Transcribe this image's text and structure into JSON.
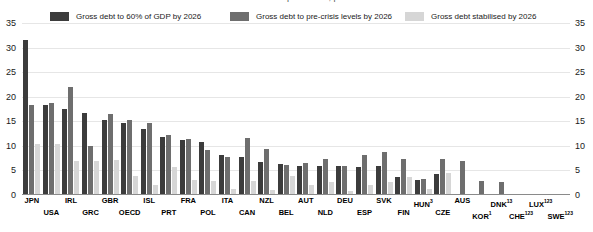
{
  "title": "Fiscal consolidation requirements, per cent of GDP",
  "legend": {
    "items": [
      {
        "label": "Gross debt to 60% of GDP by 2026",
        "color": "#3c3c3c"
      },
      {
        "label": "Gross debt to pre-crisis levels by 2026",
        "color": "#6e6e6e"
      },
      {
        "label": "Gross debt stabilised by 2026",
        "color": "#d6d6d6"
      }
    ]
  },
  "axis": {
    "left_ticks": [
      "35",
      "30",
      "25",
      "20",
      "15",
      "10",
      "5",
      "0"
    ],
    "right_ticks": [
      "35",
      "30",
      "25",
      "20",
      "15",
      "10",
      "5",
      "0"
    ]
  },
  "chart_data": {
    "type": "bar",
    "title": "Fiscal consolidation requirements, per cent of GDP",
    "xlabel": "",
    "ylabel": "",
    "ylim": [
      0,
      35
    ],
    "grid": true,
    "legend_position": "top",
    "categories": [
      "JPN",
      "USA",
      "IRL",
      "GRC",
      "GBR",
      "OECD",
      "ISL",
      "PRT",
      "FRA",
      "POL",
      "ITA",
      "CAN",
      "NZL",
      "BEL",
      "AUT",
      "NLD",
      "DEU",
      "ESP",
      "SVK",
      "FIN",
      "HUN",
      "CZE",
      "AUS",
      "KOR",
      "DNK",
      "CHE",
      "LUX",
      "SWE"
    ],
    "category_superscripts": [
      "",
      "",
      "",
      "",
      "",
      "",
      "",
      "",
      "",
      "",
      "",
      "",
      "",
      "",
      "",
      "",
      "",
      "",
      "",
      "",
      "3",
      "",
      "",
      "1",
      "13",
      "123",
      "123",
      "123"
    ],
    "series": [
      {
        "name": "Gross debt to 60% of GDP by 2026",
        "color": "#3c3c3c",
        "values": [
          31.3,
          18.2,
          17.2,
          16.5,
          15.0,
          14.5,
          13.2,
          11.6,
          11.0,
          10.5,
          8.0,
          7.5,
          6.6,
          6.2,
          5.8,
          5.8,
          5.8,
          5.5,
          5.8,
          3.4,
          2.9,
          4.1,
          0.0,
          0.0,
          0.0,
          0.0,
          0.0,
          0.0
        ]
      },
      {
        "name": "Gross debt to pre-crisis levels by 2026",
        "color": "#6e6e6e",
        "values": [
          18.2,
          18.5,
          21.7,
          9.7,
          16.3,
          15.0,
          14.5,
          12.0,
          11.2,
          9.0,
          7.6,
          11.4,
          9.2,
          6.0,
          6.4,
          7.2,
          5.8,
          8.0,
          8.5,
          7.2,
          3.0,
          7.2,
          6.8,
          2.6,
          2.4,
          0.0,
          0.0,
          0.0
        ]
      },
      {
        "name": "Gross debt stabilised by 2026",
        "color": "#d6d6d6",
        "values": [
          10.2,
          10.2,
          6.8,
          6.8,
          7.0,
          3.7,
          1.9,
          5.5,
          2.9,
          2.6,
          1.0,
          2.6,
          0.9,
          3.6,
          1.9,
          2.4,
          0.6,
          1.8,
          2.4,
          3.5,
          1.0,
          4.3,
          0.0,
          0.0,
          0.0,
          0.0,
          0.0,
          0.0
        ]
      }
    ]
  }
}
